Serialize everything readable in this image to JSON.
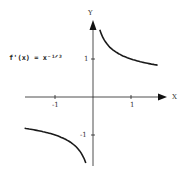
{
  "chart_data": {
    "type": "line",
    "title": "",
    "annotation": "f'(x) = x^(-1/3)",
    "annotation_display": "f'(x) = x⁻¹ᐟ³",
    "xlabel": "X",
    "ylabel": "Y",
    "xlim": [
      -1.8,
      1.95
    ],
    "ylim": [
      -1.8,
      2.0
    ],
    "x_ticks": [
      -1,
      1
    ],
    "x_tick_labels": [
      "-1",
      "1"
    ],
    "y_ticks": [
      -1,
      1
    ],
    "y_tick_labels": [
      "-1",
      "1"
    ],
    "grid": false,
    "series": [
      {
        "name": "right branch",
        "x": [
          0.18,
          0.25,
          0.35,
          0.5,
          0.75,
          1.0,
          1.25,
          1.5,
          1.7
        ],
        "y": [
          1.77,
          1.59,
          1.42,
          1.26,
          1.1,
          1.0,
          0.93,
          0.87,
          0.84
        ]
      },
      {
        "name": "left branch",
        "x": [
          -1.8,
          -1.5,
          -1.25,
          -1.0,
          -0.75,
          -0.5,
          -0.35,
          -0.25,
          -0.19
        ],
        "y": [
          -0.82,
          -0.87,
          -0.93,
          -1.0,
          -1.1,
          -1.26,
          -1.42,
          -1.59,
          -1.74
        ]
      }
    ],
    "color": "#1a1a1a"
  },
  "labels": {
    "equation": "f'(x) = x⁻¹ᐟ³",
    "x_axis": "X",
    "y_axis": "Y",
    "x_tick_neg": "-1",
    "x_tick_pos": "1",
    "y_tick_pos": "1",
    "y_tick_neg": "-1"
  }
}
